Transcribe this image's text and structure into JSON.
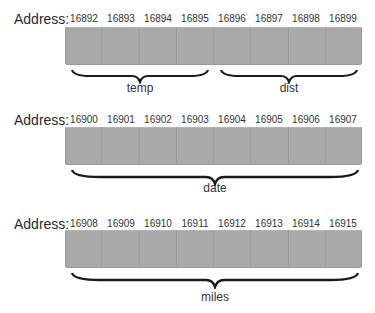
{
  "diagram": {
    "address_label": "Address:",
    "rows": [
      {
        "addresses": [
          "16892",
          "16893",
          "16894",
          "16895",
          "16896",
          "16897",
          "16898",
          "16899"
        ],
        "variables": [
          {
            "name": "temp",
            "start": 0,
            "end": 3
          },
          {
            "name": "dist",
            "start": 4,
            "end": 7
          }
        ]
      },
      {
        "addresses": [
          "16900",
          "16901",
          "16902",
          "16903",
          "16904",
          "16905",
          "16906",
          "16907"
        ],
        "variables": [
          {
            "name": "date",
            "start": 0,
            "end": 7
          }
        ]
      },
      {
        "addresses": [
          "16908",
          "16909",
          "16910",
          "16911",
          "16912",
          "16913",
          "16914",
          "16915"
        ],
        "variables": [
          {
            "name": "miles",
            "start": 0,
            "end": 7
          }
        ]
      }
    ],
    "colors": {
      "cell_fill": "#a9a9a9",
      "cell_border": "#9a9a9a",
      "brace": "#1a1a1a",
      "text": "#2a2a2a"
    }
  }
}
